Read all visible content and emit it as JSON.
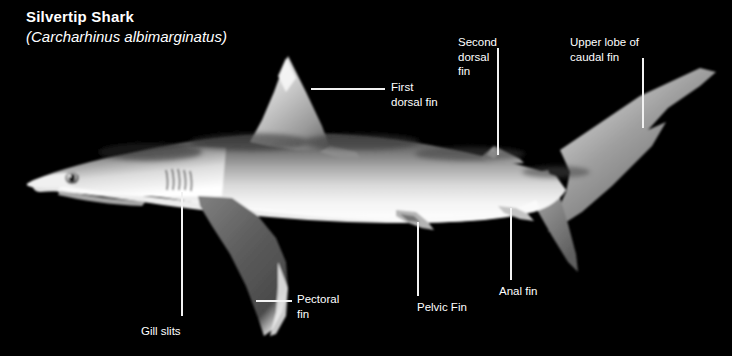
{
  "figure": {
    "background_color": "#000000",
    "text_color": "#ffffff",
    "leader_color": "#f2f2f2"
  },
  "title": {
    "common_name": "Silvertip Shark",
    "scientific_name": "(Carcharhinus albimarginatus)"
  },
  "labels": [
    {
      "id": "first-dorsal-fin",
      "text": "First\ndorsal fin",
      "x": 391,
      "y": 80,
      "leader": {
        "type": "h",
        "x": 311,
        "y": 88,
        "length": 74
      }
    },
    {
      "id": "second-dorsal-fin",
      "text": "Second\ndorsal\nfin",
      "x": 458,
      "y": 35,
      "leader": {
        "type": "v",
        "x": 497,
        "y": 48,
        "length": 107
      }
    },
    {
      "id": "upper-lobe-caudal-fin",
      "text": "Upper lobe of\ncaudal fin",
      "x": 570,
      "y": 35,
      "leader": {
        "type": "v",
        "x": 642,
        "y": 58,
        "length": 70
      }
    },
    {
      "id": "gill-slits",
      "text": "Gill slits",
      "x": 141,
      "y": 324,
      "leader": {
        "type": "v",
        "x": 181,
        "y": 192,
        "length": 124
      }
    },
    {
      "id": "pectoral-fin",
      "text": "Pectoral\nfin",
      "x": 297,
      "y": 292,
      "leader": {
        "type": "h",
        "x": 256,
        "y": 300,
        "length": 36
      }
    },
    {
      "id": "pelvic-fin",
      "text": "Pelvic Fin",
      "x": 417,
      "y": 300,
      "leader": {
        "type": "v",
        "x": 417,
        "y": 222,
        "length": 74
      }
    },
    {
      "id": "anal-fin",
      "text": "Anal fin",
      "x": 499,
      "y": 284,
      "leader": {
        "type": "v",
        "x": 510,
        "y": 208,
        "length": 72
      }
    }
  ]
}
